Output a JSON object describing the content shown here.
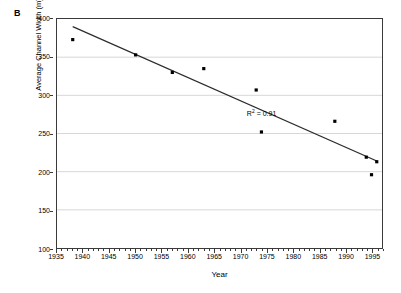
{
  "panel": {
    "label": "B"
  },
  "chart_data": {
    "type": "scatter",
    "title": "",
    "subtitle": "",
    "xlabel": "Year",
    "ylabel": "Average Channel Width (m)",
    "xlim": [
      1935,
      1997
    ],
    "ylim": [
      100,
      400
    ],
    "grid": "horizontal",
    "legend": "none",
    "x_major_ticks": [
      1935,
      1940,
      1945,
      1950,
      1955,
      1960,
      1965,
      1970,
      1975,
      1980,
      1985,
      1990,
      1995
    ],
    "x_tick_labels": [
      "1935",
      "1940",
      "1945",
      "1950",
      "1955",
      "1960",
      "1965",
      "1970",
      "1975",
      "1980",
      "1985",
      "1990",
      "1995"
    ],
    "x_minor_tick_interval": 1,
    "y_major_ticks": [
      100,
      150,
      200,
      250,
      300,
      350,
      400
    ],
    "y_tick_labels": [
      "100",
      "150",
      "200",
      "250",
      "300",
      "350",
      "400"
    ],
    "marker": "square",
    "marker_color": "#000000",
    "x": [
      1938,
      1950,
      1957,
      1963,
      1973,
      1974,
      1988,
      1994,
      1995,
      1996
    ],
    "y": [
      373,
      353,
      330,
      335,
      307,
      252,
      266,
      219,
      196,
      213
    ],
    "points": [
      {
        "x": 1938,
        "y": 373
      },
      {
        "x": 1950,
        "y": 353
      },
      {
        "x": 1957,
        "y": 330
      },
      {
        "x": 1963,
        "y": 335
      },
      {
        "x": 1973,
        "y": 307
      },
      {
        "x": 1974,
        "y": 252
      },
      {
        "x": 1988,
        "y": 266
      },
      {
        "x": 1994,
        "y": 219
      },
      {
        "x": 1995,
        "y": 196
      },
      {
        "x": 1996,
        "y": 213
      }
    ],
    "trendline": {
      "type": "linear",
      "color": "#2b2b2b",
      "x_start": 1938,
      "y_start": 390,
      "x_end": 1996,
      "y_end": 214
    },
    "annotations": [
      {
        "text": "R² = 0.91",
        "base": "R",
        "exponent": "2",
        "rest": " = 0.91",
        "x": 1971,
        "y": 279
      }
    ]
  },
  "colors": {
    "axis": "#3a3a3a",
    "grid": "#d7d7d7",
    "marker": "#000000",
    "trendline": "#2b2b2b",
    "background": "#ffffff"
  }
}
